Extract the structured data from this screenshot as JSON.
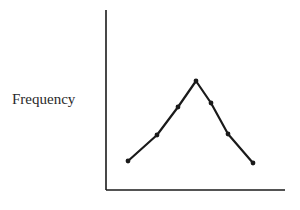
{
  "chart_data": {
    "type": "line",
    "title": "",
    "xlabel": "",
    "ylabel": "Frequency",
    "x": [
      1,
      2,
      3,
      4,
      5,
      6,
      7
    ],
    "values": [
      29,
      55,
      83,
      109,
      87,
      56,
      27
    ],
    "series": [
      {
        "name": "Frequency",
        "values": [
          29,
          55,
          83,
          109,
          87,
          56,
          27
        ]
      }
    ],
    "ylim": [
      0,
      180
    ],
    "grid": false,
    "legend": null,
    "tick_labels": "none"
  },
  "style": {
    "line_color": "#1a1a1a",
    "axis_color": "#1a1a1a",
    "label_color": "#2a2a2a"
  },
  "plot": {
    "origin_x": 106,
    "origin_y": 190,
    "x_axis_end": 285,
    "y_axis_top": 10,
    "point_x": [
      128,
      157,
      178,
      196,
      211,
      228,
      253
    ]
  }
}
